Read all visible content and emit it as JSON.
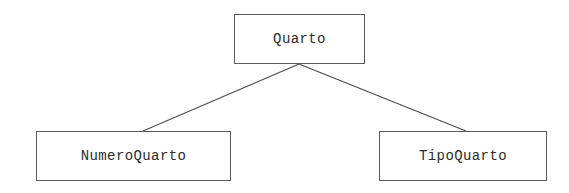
{
  "diagram": {
    "type": "hierarchy-tree",
    "background_color": "#ffffff",
    "line_color": "#4d4d4d",
    "border_color": "#5a5a5a",
    "text_color": "#2b2b2b",
    "nodes": {
      "root": {
        "label": "Quarto",
        "x": 234,
        "y": 14,
        "width": 131,
        "height": 50
      },
      "child_left": {
        "label": "NumeroQuarto",
        "x": 36,
        "y": 131,
        "width": 195,
        "height": 50
      },
      "child_right": {
        "label": "TipoQuarto",
        "x": 379,
        "y": 131,
        "width": 168,
        "height": 50
      }
    },
    "edges": [
      {
        "from": "root",
        "to": "child_left",
        "x1": 299,
        "y1": 64,
        "x2": 143,
        "y2": 131
      },
      {
        "from": "root",
        "to": "child_right",
        "x1": 299,
        "y1": 64,
        "x2": 466,
        "y2": 131
      }
    ]
  }
}
